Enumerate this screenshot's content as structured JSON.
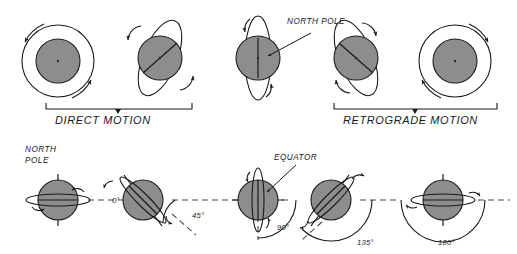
{
  "figure": {
    "title_caption_left": "DIRECT MOTION",
    "title_caption_right": "RETROGRADE MOTION",
    "background_color": "#ffffff",
    "planet_fill_color": "#8d8d8d",
    "line_color": "#1a1a1a"
  },
  "top_row": {
    "captions": {
      "direct": "DIRECT MOTION",
      "retrograde": "RETROGRADE MOTION"
    },
    "annotations": {
      "north_pole": "NORTH POLE"
    },
    "panels": [
      {
        "id": "direct-pole-view",
        "view": "pole-on",
        "spin_sense": "counterclockwise",
        "group": "direct"
      },
      {
        "id": "direct-tilted-view",
        "view": "tilted",
        "spin_sense": "counterclockwise",
        "group": "direct"
      },
      {
        "id": "direct-edge-view",
        "view": "edge-on",
        "spin_sense": "counterclockwise",
        "group": "direct",
        "pole_label": "NORTH POLE"
      },
      {
        "id": "retrograde-tilted-view",
        "view": "tilted",
        "spin_sense": "clockwise",
        "group": "retrograde"
      },
      {
        "id": "retrograde-pole-view",
        "view": "pole-on",
        "spin_sense": "clockwise",
        "group": "retrograde"
      }
    ]
  },
  "bottom_row": {
    "annotations": {
      "north_pole": "NORTH POLE",
      "north_pole_line1": "NORTH",
      "north_pole_line2": "POLE",
      "equator": "EQUATOR"
    },
    "tilt_series": [
      {
        "id": "tilt-0",
        "angle_label": "0°",
        "angle_value": 0,
        "motion": "direct"
      },
      {
        "id": "tilt-45",
        "angle_label": "45°",
        "angle_value": 45,
        "motion": "direct"
      },
      {
        "id": "tilt-90",
        "angle_label": "90°",
        "angle_value": 90,
        "motion": "direct"
      },
      {
        "id": "tilt-135",
        "angle_label": "135°",
        "angle_value": 135,
        "motion": "retrograde"
      },
      {
        "id": "tilt-180",
        "angle_label": "180°",
        "angle_value": 180,
        "motion": "retrograde"
      }
    ]
  }
}
